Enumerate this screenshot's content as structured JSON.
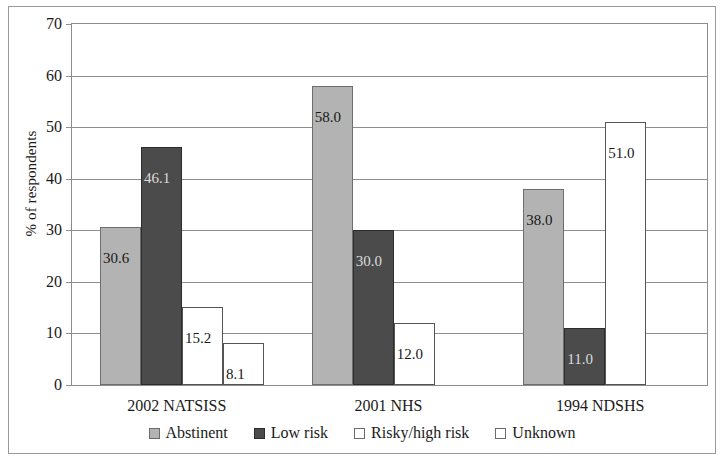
{
  "chart_data": {
    "type": "bar",
    "title": "",
    "xlabel": "",
    "ylabel": "% of respondents",
    "ylim": [
      0,
      70
    ],
    "ytick_step": 10,
    "yticks": [
      "70",
      "60",
      "50",
      "40",
      "30",
      "20",
      "10",
      "0"
    ],
    "grid": true,
    "legend_position": "bottom",
    "categories": [
      "2002 NATSISS",
      "2001 NHS",
      "1994 NDSHS"
    ],
    "series": [
      {
        "name": "Abstinent",
        "color": "#b3b3b3",
        "values": [
          30.6,
          58.0,
          38.0
        ],
        "labels": [
          "30.6",
          "58.0",
          "38.0"
        ]
      },
      {
        "name": "Low risk",
        "color": "#4b4b4b",
        "values": [
          46.1,
          30.0,
          11.0
        ],
        "labels": [
          "46.1",
          "30.0",
          "11.0"
        ]
      },
      {
        "name": "Risky/high risk",
        "color": "#ffffff",
        "values": [
          15.2,
          12.0,
          51.0
        ],
        "labels": [
          "15.2",
          "12.0",
          "51.0"
        ]
      },
      {
        "name": "Unknown",
        "color": "#ffffff",
        "values": [
          8.1,
          null,
          null
        ],
        "labels": [
          "8.1",
          "",
          ""
        ]
      }
    ]
  },
  "axis": {
    "ylabel": "% of respondents",
    "yticks": [
      "70",
      "60",
      "50",
      "40",
      "30",
      "20",
      "10",
      "0"
    ],
    "categories": [
      "2002 NATSISS",
      "2001 NHS",
      "1994 NDSHS"
    ]
  },
  "legend": {
    "items": [
      {
        "label": "Abstinent",
        "swatch": "abstinent"
      },
      {
        "label": "Low risk",
        "swatch": "low"
      },
      {
        "label": "Risky/high risk",
        "swatch": "risky"
      },
      {
        "label": "Unknown",
        "swatch": "unknown"
      }
    ]
  }
}
